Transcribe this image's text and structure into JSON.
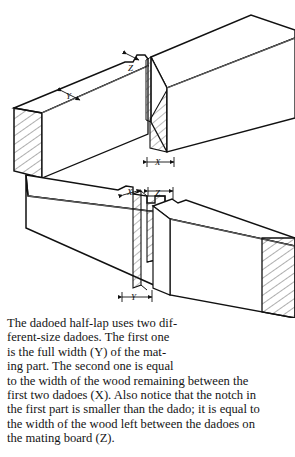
{
  "figure": {
    "name": "dadoed-half-lap-joint-diagram",
    "type": "line-drawing",
    "labels": {
      "upper_board_width_y": "Y",
      "upper_notch_z": "Z",
      "upper_gap_x": "X",
      "lower_tongue_x": "X",
      "lower_dado_z": "Z",
      "lower_width_y": "Y"
    },
    "colors": {
      "background": "#ffffff",
      "outline": "#111111",
      "hatch": "#333333",
      "interior": "#ffffff",
      "thin_line": "#777777"
    }
  },
  "caption": {
    "lines": [
      "The dadoed half-lap uses two dif-",
      "ferent-size dadoes. The first one",
      "is the full width (Y) of the mat-",
      "ing part. The second one is equal",
      "to the width of the wood remaining between the",
      "first two dadoes (X). Also notice that the notch in",
      "the first part is smaller than the dado; it is equal to",
      "the width of the wood left between the dadoes on",
      "the mating board (Z)."
    ],
    "full_text": "The dadoed half-lap uses two different-size dadoes. The first one is the full width (Y) of the mating part. The second one is equal to the width of the wood remaining between the first two dadoes (X). Also notice that the notch in the first part is smaller than the dado; it is equal to the width of the wood left between the dadoes on the mating board (Z)."
  }
}
